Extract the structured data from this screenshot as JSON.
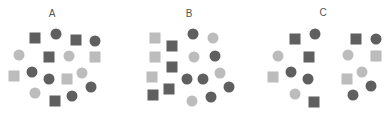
{
  "colors": {
    "dark": "#5f5f5f",
    "light": "#bcbcbc",
    "label": "#555555"
  },
  "panels": [
    {
      "label": "A",
      "label_pos": [
        52,
        14
      ],
      "shapes": [
        {
          "type": "square",
          "tone": "dark",
          "x": 35,
          "y": 38
        },
        {
          "type": "circle",
          "tone": "dark",
          "x": 56,
          "y": 34
        },
        {
          "type": "square",
          "tone": "dark",
          "x": 76,
          "y": 40
        },
        {
          "type": "circle",
          "tone": "dark",
          "x": 95,
          "y": 41
        },
        {
          "type": "circle",
          "tone": "light",
          "x": 19,
          "y": 55
        },
        {
          "type": "square",
          "tone": "dark",
          "x": 49,
          "y": 57
        },
        {
          "type": "circle",
          "tone": "light",
          "x": 69,
          "y": 56
        },
        {
          "type": "square",
          "tone": "light",
          "x": 95,
          "y": 57
        },
        {
          "type": "square",
          "tone": "light",
          "x": 14,
          "y": 76
        },
        {
          "type": "circle",
          "tone": "dark",
          "x": 32,
          "y": 72
        },
        {
          "type": "circle",
          "tone": "dark",
          "x": 49,
          "y": 79
        },
        {
          "type": "square",
          "tone": "light",
          "x": 67,
          "y": 79
        },
        {
          "type": "circle",
          "tone": "light",
          "x": 82,
          "y": 73
        },
        {
          "type": "circle",
          "tone": "dark",
          "x": 91,
          "y": 87
        },
        {
          "type": "circle",
          "tone": "light",
          "x": 35,
          "y": 93
        },
        {
          "type": "circle",
          "tone": "dark",
          "x": 72,
          "y": 96
        },
        {
          "type": "square",
          "tone": "dark",
          "x": 55,
          "y": 101
        }
      ]
    },
    {
      "label": "B",
      "label_pos": [
        189,
        14
      ],
      "shapes": [
        {
          "type": "square",
          "tone": "light",
          "x": 155,
          "y": 38
        },
        {
          "type": "square",
          "tone": "dark",
          "x": 172,
          "y": 46
        },
        {
          "type": "circle",
          "tone": "dark",
          "x": 193,
          "y": 34
        },
        {
          "type": "circle",
          "tone": "light",
          "x": 213,
          "y": 38
        },
        {
          "type": "square",
          "tone": "light",
          "x": 155,
          "y": 57
        },
        {
          "type": "circle",
          "tone": "light",
          "x": 194,
          "y": 57
        },
        {
          "type": "circle",
          "tone": "dark",
          "x": 215,
          "y": 56
        },
        {
          "type": "square",
          "tone": "dark",
          "x": 172,
          "y": 67
        },
        {
          "type": "square",
          "tone": "light",
          "x": 152,
          "y": 77
        },
        {
          "type": "circle",
          "tone": "dark",
          "x": 187,
          "y": 79
        },
        {
          "type": "circle",
          "tone": "dark",
          "x": 203,
          "y": 79
        },
        {
          "type": "circle",
          "tone": "light",
          "x": 220,
          "y": 73
        },
        {
          "type": "square",
          "tone": "dark",
          "x": 169,
          "y": 89
        },
        {
          "type": "square",
          "tone": "dark",
          "x": 153,
          "y": 95
        },
        {
          "type": "circle",
          "tone": "dark",
          "x": 229,
          "y": 87
        },
        {
          "type": "circle",
          "tone": "dark",
          "x": 211,
          "y": 97
        },
        {
          "type": "circle",
          "tone": "light",
          "x": 192,
          "y": 101
        }
      ]
    },
    {
      "label": "C",
      "label_pos": [
        323,
        13
      ],
      "shapes": [
        {
          "type": "square",
          "tone": "dark",
          "x": 295,
          "y": 39
        },
        {
          "type": "circle",
          "tone": "dark",
          "x": 315,
          "y": 34
        },
        {
          "type": "circle",
          "tone": "light",
          "x": 278,
          "y": 56
        },
        {
          "type": "square",
          "tone": "dark",
          "x": 309,
          "y": 57
        },
        {
          "type": "square",
          "tone": "light",
          "x": 273,
          "y": 77
        },
        {
          "type": "circle",
          "tone": "dark",
          "x": 291,
          "y": 72
        },
        {
          "type": "circle",
          "tone": "dark",
          "x": 308,
          "y": 79
        },
        {
          "type": "circle",
          "tone": "light",
          "x": 295,
          "y": 94
        },
        {
          "type": "square",
          "tone": "dark",
          "x": 314,
          "y": 102
        },
        {
          "type": "square",
          "tone": "dark",
          "x": 356,
          "y": 39
        },
        {
          "type": "circle",
          "tone": "dark",
          "x": 376,
          "y": 39
        },
        {
          "type": "circle",
          "tone": "light",
          "x": 348,
          "y": 55
        },
        {
          "type": "square",
          "tone": "light",
          "x": 376,
          "y": 56
        },
        {
          "type": "circle",
          "tone": "light",
          "x": 362,
          "y": 72
        },
        {
          "type": "square",
          "tone": "light",
          "x": 347,
          "y": 79
        },
        {
          "type": "circle",
          "tone": "dark",
          "x": 371,
          "y": 86
        },
        {
          "type": "circle",
          "tone": "dark",
          "x": 353,
          "y": 95
        }
      ]
    }
  ]
}
